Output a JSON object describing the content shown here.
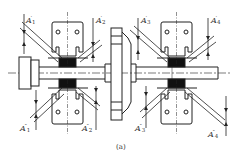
{
  "diagram": {
    "caption": "(a)",
    "colors": {
      "line": "#222222",
      "fill_black": "#111111",
      "background": "#ffffff"
    },
    "components": [
      {
        "id": "shaft",
        "label": "shaft"
      },
      {
        "id": "bearing-housing-left",
        "label": "bearing housing 1"
      },
      {
        "id": "coupling-flange",
        "label": "coupling flange"
      },
      {
        "id": "bearing-housing-right",
        "label": "bearing housing 2"
      },
      {
        "id": "shaft-end-collar",
        "label": "shaft end collar"
      }
    ],
    "labels_top": [
      {
        "base": "A",
        "prime": "′",
        "sub": "1"
      },
      {
        "base": "A",
        "prime": "′",
        "sub": "2"
      },
      {
        "base": "A",
        "prime": "′",
        "sub": "3"
      },
      {
        "base": "A",
        "prime": "′",
        "sub": "4"
      }
    ],
    "labels_bottom": [
      {
        "base": "A",
        "prime": "″",
        "sub": "1"
      },
      {
        "base": "A",
        "prime": "″",
        "sub": "2"
      },
      {
        "base": "A",
        "prime": "″",
        "sub": "3"
      },
      {
        "base": "A",
        "prime": "″",
        "sub": "4"
      }
    ]
  }
}
